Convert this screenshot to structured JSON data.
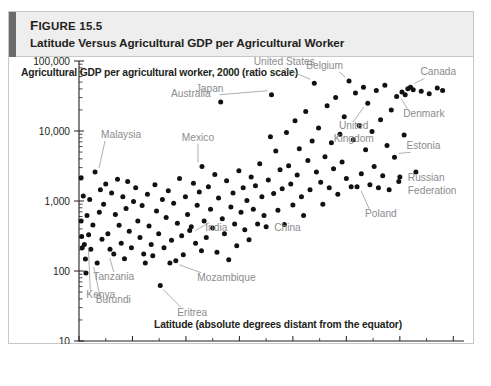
{
  "figure": {
    "number_prefix": "F",
    "number_rest": "IGURE",
    "number": "15.5",
    "title": "Latitude Versus Agricultural GDP per Agricultural Worker",
    "accent_color": "#6b6b6b",
    "header_bg": "#eeeeee"
  },
  "chart_data": {
    "type": "scatter",
    "title": "Agricultural GDP per agricultural worker, 2000 (ratio scale)",
    "xlabel": "Latitude (absolute degrees distant from the equator)",
    "ylabel": "Agricultural GDP per agricultural worker, 2000 (ratio scale)",
    "yscale": "log",
    "xscale": "linear",
    "xlim": [
      0,
      72
    ],
    "ylim": [
      10,
      100000
    ],
    "grid": false,
    "legend": "none",
    "xticks": [
      "0",
      "10",
      "20",
      "30",
      "40",
      "50",
      "60",
      "70"
    ],
    "xtick_values": [
      0,
      10,
      20,
      30,
      40,
      50,
      60,
      70
    ],
    "yticks": [
      "10",
      "100",
      "1,000",
      "10,000",
      "100,000"
    ],
    "ytick_values": [
      10,
      100,
      1000,
      10000,
      100000
    ],
    "point_color": "#111111",
    "label_color": "#8c8c8c",
    "annotations": [
      {
        "name": "Malaysia",
        "x": 3.0,
        "y": 2600
      },
      {
        "name": "Australia",
        "x": 26.5,
        "y": 26000
      },
      {
        "name": "Japan",
        "x": 36.0,
        "y": 33000
      },
      {
        "name": "United States",
        "x": 44.0,
        "y": 48000
      },
      {
        "name": "Belgium",
        "x": 50.5,
        "y": 52000
      },
      {
        "name": "Canada",
        "x": 62.0,
        "y": 42000
      },
      {
        "name": "United Kingdom",
        "x": 54.0,
        "y": 25000
      },
      {
        "name": "Denmark",
        "x": 61.0,
        "y": 33000
      },
      {
        "name": "Mexico",
        "x": 23.0,
        "y": 3100
      },
      {
        "name": "Estonia",
        "x": 59.0,
        "y": 4200
      },
      {
        "name": "Russian Federation",
        "x": 60.0,
        "y": 2200
      },
      {
        "name": "Poland",
        "x": 52.0,
        "y": 1600
      },
      {
        "name": "India",
        "x": 21.0,
        "y": 430
      },
      {
        "name": "China",
        "x": 35.0,
        "y": 430
      },
      {
        "name": "Tanzania",
        "x": 6.5,
        "y": 175
      },
      {
        "name": "Burundi",
        "x": 3.5,
        "y": 130
      },
      {
        "name": "Kenya",
        "x": 1.0,
        "y": 240
      },
      {
        "name": "Mozambique",
        "x": 18.0,
        "y": 140
      },
      {
        "name": "Eritrea",
        "x": 15.0,
        "y": 62
      }
    ],
    "points": [
      [
        0.4,
        2150
      ],
      [
        0.4,
        520
      ],
      [
        0.5,
        310
      ],
      [
        0.6,
        215
      ],
      [
        0.8,
        1180
      ],
      [
        1.0,
        240
      ],
      [
        1.2,
        148
      ],
      [
        1.3,
        94
      ],
      [
        1.5,
        620
      ],
      [
        1.8,
        330
      ],
      [
        2.0,
        1050
      ],
      [
        2.2,
        205
      ],
      [
        2.6,
        455
      ],
      [
        3.0,
        2600
      ],
      [
        3.4,
        130
      ],
      [
        3.8,
        690
      ],
      [
        4.0,
        1450
      ],
      [
        4.3,
        285
      ],
      [
        4.6,
        900
      ],
      [
        5.0,
        1750
      ],
      [
        5.4,
        340
      ],
      [
        5.8,
        205
      ],
      [
        6.1,
        1300
      ],
      [
        6.5,
        175
      ],
      [
        6.8,
        640
      ],
      [
        7.2,
        2050
      ],
      [
        7.5,
        450
      ],
      [
        7.9,
        250
      ],
      [
        8.2,
        1150
      ],
      [
        8.5,
        150
      ],
      [
        8.8,
        780
      ],
      [
        9.1,
        1900
      ],
      [
        9.4,
        370
      ],
      [
        9.8,
        215
      ],
      [
        10.2,
        980
      ],
      [
        10.6,
        1550
      ],
      [
        11.0,
        520
      ],
      [
        11.4,
        300
      ],
      [
        11.8,
        860
      ],
      [
        12.1,
        175
      ],
      [
        12.4,
        130
      ],
      [
        12.8,
        1250
      ],
      [
        13.1,
        440
      ],
      [
        13.5,
        240
      ],
      [
        13.8,
        165
      ],
      [
        14.2,
        1700
      ],
      [
        14.5,
        720
      ],
      [
        14.9,
        340
      ],
      [
        15.2,
        62
      ],
      [
        15.6,
        1050
      ],
      [
        15.9,
        215
      ],
      [
        16.3,
        580
      ],
      [
        16.7,
        1400
      ],
      [
        17.0,
        130
      ],
      [
        17.3,
        275
      ],
      [
        17.7,
        930
      ],
      [
        18.1,
        140
      ],
      [
        18.4,
        480
      ],
      [
        18.8,
        2100
      ],
      [
        19.2,
        320
      ],
      [
        19.5,
        170
      ],
      [
        19.9,
        1150
      ],
      [
        20.3,
        640
      ],
      [
        20.7,
        380
      ],
      [
        21.0,
        430
      ],
      [
        21.4,
        1800
      ],
      [
        21.8,
        250
      ],
      [
        22.1,
        870
      ],
      [
        22.5,
        1350
      ],
      [
        22.9,
        195
      ],
      [
        23.0,
        3100
      ],
      [
        23.4,
        520
      ],
      [
        23.8,
        300
      ],
      [
        24.2,
        1600
      ],
      [
        24.6,
        760
      ],
      [
        25.0,
        410
      ],
      [
        25.4,
        2400
      ],
      [
        25.8,
        185
      ],
      [
        26.1,
        1100
      ],
      [
        26.5,
        26000
      ],
      [
        26.8,
        560
      ],
      [
        27.2,
        340
      ],
      [
        27.6,
        1950
      ],
      [
        28.0,
        145
      ],
      [
        28.4,
        820
      ],
      [
        28.8,
        1300
      ],
      [
        29.1,
        470
      ],
      [
        29.5,
        230
      ],
      [
        29.9,
        2700
      ],
      [
        30.3,
        690
      ],
      [
        30.7,
        1550
      ],
      [
        31.0,
        390
      ],
      [
        31.4,
        1020
      ],
      [
        31.8,
        280
      ],
      [
        32.2,
        2200
      ],
      [
        32.6,
        760
      ],
      [
        33.0,
        1650
      ],
      [
        33.4,
        470
      ],
      [
        33.8,
        3400
      ],
      [
        34.2,
        1150
      ],
      [
        34.6,
        620
      ],
      [
        35.0,
        430
      ],
      [
        35.4,
        2000
      ],
      [
        35.8,
        8300
      ],
      [
        36.0,
        33000
      ],
      [
        36.4,
        1280
      ],
      [
        36.8,
        5200
      ],
      [
        37.2,
        740
      ],
      [
        37.6,
        2800
      ],
      [
        38.0,
        1500
      ],
      [
        38.4,
        460
      ],
      [
        38.8,
        9500
      ],
      [
        39.2,
        3200
      ],
      [
        39.6,
        1750
      ],
      [
        40.0,
        880
      ],
      [
        40.4,
        14000
      ],
      [
        40.8,
        2350
      ],
      [
        41.2,
        5600
      ],
      [
        41.6,
        1150
      ],
      [
        42.0,
        620
      ],
      [
        42.4,
        19000
      ],
      [
        42.8,
        3800
      ],
      [
        43.2,
        1450
      ],
      [
        43.6,
        7200
      ],
      [
        44.0,
        48000
      ],
      [
        44.4,
        2600
      ],
      [
        44.8,
        11000
      ],
      [
        45.2,
        1850
      ],
      [
        45.6,
        900
      ],
      [
        46.0,
        4300
      ],
      [
        46.4,
        23000
      ],
      [
        46.8,
        1550
      ],
      [
        47.2,
        6800
      ],
      [
        47.6,
        2900
      ],
      [
        48.0,
        30000
      ],
      [
        48.4,
        1250
      ],
      [
        48.8,
        9000
      ],
      [
        49.2,
        3600
      ],
      [
        49.6,
        16000
      ],
      [
        50.0,
        2100
      ],
      [
        50.5,
        52000
      ],
      [
        50.9,
        1600
      ],
      [
        51.3,
        7500
      ],
      [
        51.7,
        35000
      ],
      [
        52.0,
        1600
      ],
      [
        52.4,
        12000
      ],
      [
        52.8,
        2450
      ],
      [
        53.2,
        42000
      ],
      [
        53.6,
        5400
      ],
      [
        54.0,
        25000
      ],
      [
        54.4,
        1700
      ],
      [
        54.8,
        9800
      ],
      [
        55.2,
        3100
      ],
      [
        55.6,
        38000
      ],
      [
        56.0,
        1550
      ],
      [
        56.4,
        14500
      ],
      [
        56.8,
        2300
      ],
      [
        57.2,
        45000
      ],
      [
        57.6,
        6200
      ],
      [
        58.0,
        1450
      ],
      [
        58.4,
        20000
      ],
      [
        59.0,
        4200
      ],
      [
        59.4,
        31000
      ],
      [
        59.8,
        1900
      ],
      [
        60.0,
        2200
      ],
      [
        60.4,
        36000
      ],
      [
        60.8,
        8800
      ],
      [
        61.0,
        33000
      ],
      [
        61.5,
        40000
      ],
      [
        62.0,
        42000
      ],
      [
        62.5,
        39000
      ],
      [
        63.0,
        2600
      ],
      [
        64.0,
        37000
      ],
      [
        65.5,
        34000
      ],
      [
        67.0,
        41000
      ],
      [
        68.0,
        38000
      ]
    ]
  }
}
